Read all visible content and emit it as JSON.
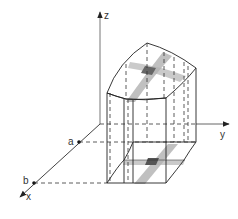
{
  "diagram": {
    "type": "3d-region-volume",
    "axes": {
      "x_label": "x",
      "y_label": "y",
      "z_label": "z"
    },
    "points": {
      "a_label": "a",
      "b_label": "b"
    },
    "colors": {
      "line": "#2a2a2a",
      "axis": "#555555",
      "shade": "#9a9a9a",
      "shade_dark": "#555555",
      "background": "#ffffff"
    }
  }
}
